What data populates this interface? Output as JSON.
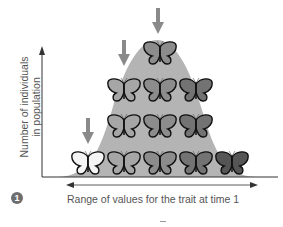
{
  "figure": {
    "step_number": "1",
    "y_axis_label_line1": "Number of individuals",
    "y_axis_label_line2": "in population",
    "x_axis_label": "Range of values for the trait at time 1",
    "colors": {
      "curve_fill": "#b4b4b4",
      "arrow": "#8a8a8a",
      "axis": "#333333",
      "text": "#555555"
    }
  },
  "butterfly_rows": [
    {
      "row": 1,
      "count": 5,
      "shades": [
        "light",
        "light-mid",
        "mid",
        "mid-dark",
        "dark"
      ]
    },
    {
      "row": 2,
      "count": 3,
      "shades": [
        "light-mid",
        "mid",
        "mid-dark"
      ]
    },
    {
      "row": 3,
      "count": 3,
      "shades": [
        "light-mid",
        "mid",
        "mid-dark"
      ]
    },
    {
      "row": 4,
      "count": 1,
      "shades": [
        "mid"
      ]
    }
  ],
  "arrows": [
    {
      "target": "lightest butterfly, bottom row"
    },
    {
      "target": "left butterfly, third row"
    },
    {
      "target": "top butterfly"
    }
  ]
}
